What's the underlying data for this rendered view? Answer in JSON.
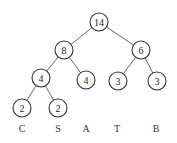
{
  "diagram": {
    "type": "huffman-tree",
    "colors": {
      "stroke": "#333333",
      "edge": "#555555",
      "text": "#222222",
      "background": "#ffffff"
    },
    "nodes": [
      {
        "id": "n14",
        "value": "14",
        "x": 99,
        "y": 22
      },
      {
        "id": "n8",
        "value": "8",
        "x": 64,
        "y": 50
      },
      {
        "id": "n6",
        "value": "6",
        "x": 141,
        "y": 50
      },
      {
        "id": "n4a",
        "value": "4",
        "x": 41,
        "y": 78
      },
      {
        "id": "n4b",
        "value": "4",
        "x": 86,
        "y": 80
      },
      {
        "id": "n3a",
        "value": "3",
        "x": 118,
        "y": 81
      },
      {
        "id": "n3b",
        "value": "3",
        "x": 157,
        "y": 81
      },
      {
        "id": "n2a",
        "value": "2",
        "x": 22,
        "y": 108
      },
      {
        "id": "n2b",
        "value": "2",
        "x": 58,
        "y": 108
      }
    ],
    "edges": [
      [
        "n14",
        "n8"
      ],
      [
        "n14",
        "n6"
      ],
      [
        "n8",
        "n4a"
      ],
      [
        "n8",
        "n4b"
      ],
      [
        "n6",
        "n3a"
      ],
      [
        "n6",
        "n3b"
      ],
      [
        "n4a",
        "n2a"
      ],
      [
        "n4a",
        "n2b"
      ]
    ],
    "leaf_labels": [
      {
        "text": "C",
        "x": 22,
        "y": 128
      },
      {
        "text": "S",
        "x": 58,
        "y": 128
      },
      {
        "text": "A",
        "x": 86,
        "y": 128
      },
      {
        "text": "T",
        "x": 117,
        "y": 128
      },
      {
        "text": "B",
        "x": 156,
        "y": 128
      }
    ],
    "node_radius": 9
  }
}
